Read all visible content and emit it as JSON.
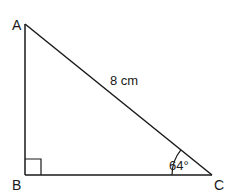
{
  "diagram": {
    "type": "right-triangle",
    "vertices": [
      {
        "id": "A",
        "label": "A",
        "x": 25,
        "y": 24
      },
      {
        "id": "B",
        "label": "B",
        "x": 25,
        "y": 175
      },
      {
        "id": "C",
        "label": "C",
        "x": 212,
        "y": 175
      }
    ],
    "hypotenuse_label": "8 cm",
    "angle_label": "64°",
    "right_angle_at": "B",
    "stroke_color": "#1a1a1a",
    "background_color": "#ffffff"
  }
}
